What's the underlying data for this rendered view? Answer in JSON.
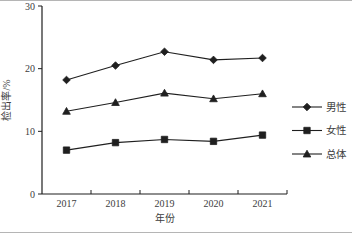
{
  "figure": {
    "background": "#ffffff",
    "frame_color": "#b5b5b5"
  },
  "chart_data": {
    "type": "line",
    "title": "",
    "xlabel": "年份",
    "ylabel": "检出率/%",
    "categories": [
      "2017",
      "2018",
      "2019",
      "2020",
      "2021"
    ],
    "series": [
      {
        "name": "男性",
        "marker": "diamond",
        "values": [
          18.2,
          20.5,
          22.7,
          21.4,
          21.7
        ]
      },
      {
        "name": "女性",
        "marker": "square",
        "values": [
          7.0,
          8.2,
          8.7,
          8.4,
          9.4
        ]
      },
      {
        "name": "总体",
        "marker": "triangle",
        "values": [
          13.2,
          14.6,
          16.1,
          15.2,
          16.0
        ]
      }
    ],
    "ylim": [
      0,
      30
    ],
    "yticks": [
      0,
      10,
      20,
      30
    ],
    "grid": false,
    "legend_position": "right",
    "line_color": "#1f1f1f",
    "marker_color": "#1f1f1f",
    "text_color": "#3d3d3d"
  }
}
